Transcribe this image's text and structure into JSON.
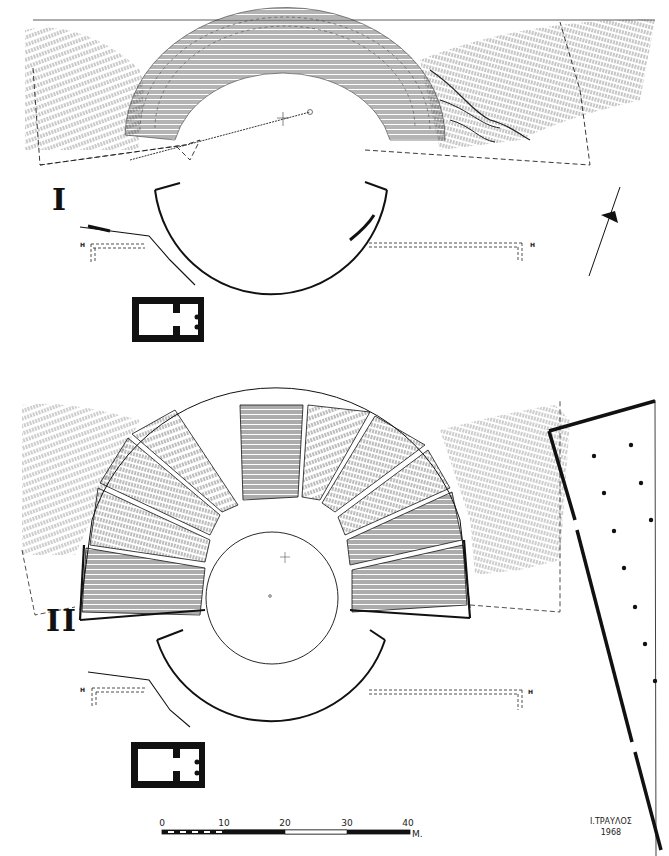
{
  "plate": {
    "subject": "Theatre plan drawing, two phases",
    "background": "#ffffff",
    "ink": "#111111"
  },
  "plans": [
    {
      "id": "I",
      "label": "I",
      "description": "Earlier phase: terrain hachures with semicircular cavea outline, orchestra arc, retaining walls and small temple"
    },
    {
      "id": "II",
      "label": "II",
      "description": "Later phase: cavea with radial kerkides of seats, circular orchestra, stage arc, retaining walls, temple and stoa"
    }
  ],
  "markers": {
    "h_left_1": "H",
    "h_right_1": "H",
    "h_left_2": "H",
    "h_right_2": "H"
  },
  "north_arrow": {
    "label": "north-arrow"
  },
  "scale_bar": {
    "ticks": [
      "0",
      "10",
      "20",
      "30",
      "40"
    ],
    "unit": "M.",
    "range_m": [
      0,
      40
    ]
  },
  "credit": {
    "author": "Ι.ΤΡΑΥΛΟΣ",
    "year": "1968"
  }
}
